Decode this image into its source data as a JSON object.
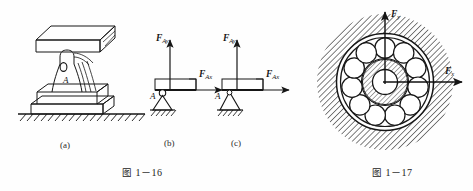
{
  "figures": [
    {
      "id": "figure-1-16",
      "caption_cjk": "图",
      "caption_num": "1－16",
      "subfigures": [
        {
          "key": "a",
          "label": "(a)",
          "point_label": "A"
        },
        {
          "key": "b",
          "label": "(b)",
          "point_label": "A",
          "forces": [
            {
              "name": "F-Ay",
              "symbol": "F",
              "sub": "Ay",
              "direction": "up"
            },
            {
              "name": "F-Ax",
              "symbol": "F",
              "sub": "Ax",
              "direction": "right"
            }
          ]
        },
        {
          "key": "c",
          "label": "(c)",
          "point_label": "A",
          "forces": [
            {
              "name": "F-Ay",
              "symbol": "F",
              "sub": "Ay",
              "direction": "up"
            },
            {
              "name": "F-Ax",
              "symbol": "F",
              "sub": "Ax",
              "direction": "right"
            }
          ]
        }
      ]
    },
    {
      "id": "figure-1-17",
      "caption_cjk": "图",
      "caption_num": "1－17",
      "ball_count": 11,
      "forces": [
        {
          "name": "F-y",
          "symbol": "F",
          "sub": "y",
          "direction": "up"
        },
        {
          "name": "F-x",
          "symbol": "F",
          "sub": "x",
          "direction": "right"
        }
      ]
    }
  ],
  "colors": {
    "ink": "#1a1a1a",
    "background": "#fefefe",
    "hatch": "#2b2b2b"
  }
}
